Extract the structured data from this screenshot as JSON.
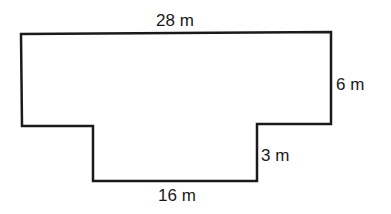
{
  "figure": {
    "type": "composite rectilinear shape",
    "labels": {
      "top_width": "28 m",
      "right_height": "6 m",
      "step_height": "3 m",
      "bottom_width": "16 m"
    },
    "dimensions_m": {
      "top_width": 28,
      "right_height": 6,
      "step_height": 3,
      "bottom_width": 16
    },
    "stroke_color": "#1a1a1a",
    "background_color": "#ffffff"
  }
}
